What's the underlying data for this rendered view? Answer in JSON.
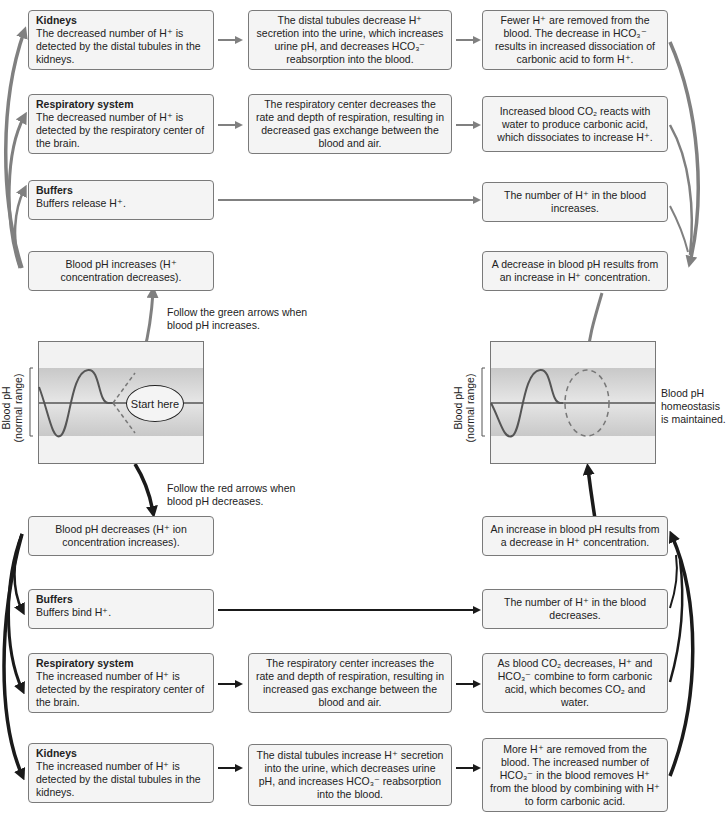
{
  "colors": {
    "green_arrow": "#808080",
    "red_arrow": "#1a1a1a",
    "box_border": "#7a7a7a",
    "box_fill": "#f4f4f4",
    "band_fill": "#bdbdbd"
  },
  "increase_path": {
    "kidneys": {
      "title": "Kidneys",
      "body": "The decreased number of H⁺ is detected by the distal tubules in the kidneys."
    },
    "kidneys_response": "The distal tubules decrease H⁺ secretion into the urine, which increases urine pH, and decreases HCO₃⁻ reabsorption into the blood.",
    "kidneys_result": "Fewer H⁺ are removed from the blood. The decrease in HCO₃⁻ results in increased dissociation of carbonic acid to form H⁺.",
    "respiratory": {
      "title": "Respiratory system",
      "body": "The decreased number of H⁺ is detected by the respiratory center of the brain."
    },
    "respiratory_response": "The respiratory center decreases the rate and depth of respiration, resulting in decreased gas exchange between the blood and air.",
    "respiratory_result": "Increased blood CO₂ reacts with water to produce carbonic acid, which dissociates to increase H⁺.",
    "buffers": {
      "title": "Buffers",
      "body": "Buffers release H⁺."
    },
    "buffers_result": "The number of H⁺ in the blood increases.",
    "trigger": "Blood pH increases (H⁺ concentration decreases).",
    "outcome": "A decrease in blood pH results from an increase in H⁺ concentration.",
    "instruction": "Follow the green arrows when blood pH increases."
  },
  "decrease_path": {
    "trigger": "Blood pH decreases (H⁺ ion concentration increases).",
    "buffers": {
      "title": "Buffers",
      "body": "Buffers bind H⁺."
    },
    "buffers_result": "The number of H⁺ in the blood decreases.",
    "respiratory": {
      "title": "Respiratory system",
      "body": "The increased number of H⁺ is detected by the respiratory center of the brain."
    },
    "respiratory_response": "The respiratory center increases the rate and depth of respiration, resulting in increased gas exchange between the blood and air.",
    "respiratory_result": "As blood CO₂ decreases, H⁺ and HCO₃⁻ combine to form carbonic acid, which becomes CO₂ and water.",
    "kidneys": {
      "title": "Kidneys",
      "body": "The increased number of H⁺ is detected by the distal tubules in the kidneys."
    },
    "kidneys_response": "The distal tubules increase H⁺ secretion into the urine, which decreases urine pH, and increases HCO₃⁻ reabsorption into the blood.",
    "kidneys_result": "More H⁺ are removed from the blood. The increased number of HCO₃⁻ in the blood removes H⁺ from the blood by combining with H⁺ to form carbonic acid.",
    "outcome": "An increase in blood pH results from a decrease in H⁺ concentration.",
    "instruction": "Follow the red arrows when blood pH decreases."
  },
  "graphs": {
    "axis_label_line1": "Blood pH",
    "axis_label_line2": "(normal range)",
    "start_label": "Start here",
    "homeostasis_label": "Blood pH homeostasis is maintained."
  }
}
